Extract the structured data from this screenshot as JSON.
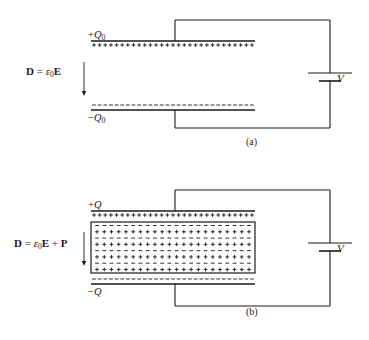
{
  "document": {
    "type": "physics-diagram",
    "subject": "Parallel-plate capacitor with and without dielectric",
    "background_color": "#ffffff",
    "ink_color": "#1a1a1a"
  },
  "figures": [
    {
      "id": "a",
      "caption": "(a)",
      "equation": {
        "lhs": "D",
        "equals": "=",
        "eps": "ε",
        "eps_sub": "0",
        "field": "E",
        "full_text": "D = ε0E"
      },
      "top_plate": {
        "charge_label_sign": "+",
        "charge_label_symbol": "Q",
        "charge_label_sub": "0",
        "charge_label_full": "+Q0",
        "surface_charge_glyph": "+",
        "surface_charge_count": 29
      },
      "bottom_plate": {
        "charge_label_sign": "−",
        "charge_label_symbol": "Q",
        "charge_label_sub": "0",
        "charge_label_full": "−Q0",
        "surface_charge_glyph": "−",
        "surface_charge_count": 29
      },
      "dielectric": null,
      "battery": {
        "label": "V",
        "long_plate_label": "positive-terminal",
        "short_plate_label": "negative-terminal"
      },
      "field_arrow": {
        "direction": "down"
      }
    },
    {
      "id": "b",
      "caption": "(b)",
      "equation": {
        "lhs": "D",
        "equals": "=",
        "eps": "ε",
        "eps_sub": "0",
        "field": "E",
        "plus": "+",
        "polarization": "P",
        "full_text": "D = ε0E + P"
      },
      "top_plate": {
        "charge_label_sign": "+",
        "charge_label_symbol": "Q",
        "charge_label_sub": "",
        "charge_label_full": "+Q",
        "surface_charge_glyph": "+",
        "surface_charge_count": 29
      },
      "bottom_plate": {
        "charge_label_sign": "−",
        "charge_label_symbol": "Q",
        "charge_label_sub": "",
        "charge_label_full": "−Q",
        "surface_charge_glyph": "−",
        "surface_charge_count": 29
      },
      "dielectric": {
        "name": "dielectric-slab",
        "rows": [
          {
            "glyph": "−",
            "count": 22
          },
          {
            "glyph": "+",
            "count": 22
          },
          {
            "glyph": "−",
            "count": 22
          },
          {
            "glyph": "+",
            "count": 22
          },
          {
            "glyph": "−",
            "count": 22
          },
          {
            "glyph": "+",
            "count": 22
          },
          {
            "glyph": "−",
            "count": 22
          },
          {
            "glyph": "+",
            "count": 22
          }
        ]
      },
      "battery": {
        "label": "V",
        "long_plate_label": "positive-terminal",
        "short_plate_label": "negative-terminal"
      },
      "field_arrow": {
        "direction": "down"
      }
    }
  ]
}
